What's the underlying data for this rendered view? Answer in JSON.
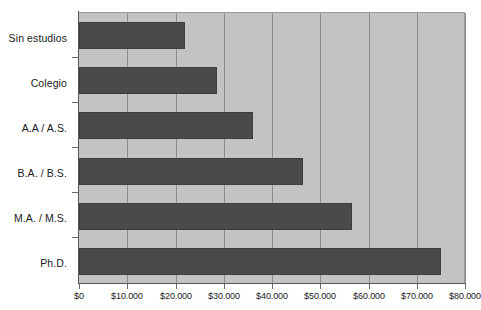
{
  "chart_data": {
    "type": "bar",
    "orientation": "horizontal",
    "title": "",
    "subtitle": "",
    "xlabel": "",
    "ylabel": "",
    "categories": [
      "Sin estudios",
      "Colegio",
      "A.A / A.S.",
      "B.A. / B.S.",
      "M.A. / M.S.",
      "Ph.D."
    ],
    "values": [
      22000,
      28500,
      36000,
      46500,
      56500,
      75000
    ],
    "series": [
      {
        "name": "",
        "values": [
          22000,
          28500,
          36000,
          46500,
          56500,
          75000
        ]
      }
    ],
    "xlim": [
      0,
      80000
    ],
    "ylim": [
      0,
      6
    ],
    "xtick_values": [
      0,
      10000,
      20000,
      30000,
      40000,
      50000,
      60000,
      70000,
      80000
    ],
    "xtick_labels": [
      "$0",
      "$10.000",
      "$20.000",
      "$30.000",
      "$40.000",
      "$50.000",
      "$60.000",
      "$70.000",
      "$80.000"
    ],
    "grid": "vertical",
    "legend": "none",
    "annotations": [],
    "colors": {
      "bar": "#4a4a4a",
      "bar_border": "#3d3d3d",
      "plot_background": "#c3c3c3",
      "gridline": "#8d8d8d",
      "axis": "#5a5a5a",
      "text": "#1a1a1a",
      "page_background": "#ffffff"
    }
  }
}
